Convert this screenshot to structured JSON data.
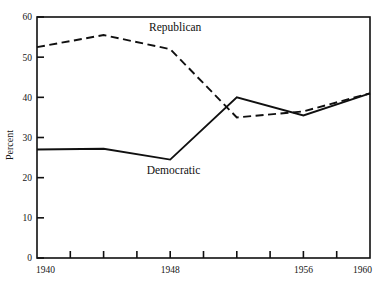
{
  "chart_data": {
    "type": "line",
    "title": "",
    "subtitle": "",
    "xlabel": "",
    "ylabel": "Percent",
    "xlim": [
      1940,
      1960
    ],
    "ylim": [
      0,
      60
    ],
    "grid": false,
    "legend_position": "inline-annotation",
    "x": [
      1940,
      1944,
      1948,
      1952,
      1956,
      1960
    ],
    "x_tick_values": [
      1940,
      1942,
      1944,
      1946,
      1948,
      1950,
      1952,
      1954,
      1956,
      1958,
      1960
    ],
    "x_tick_labels": [
      "1940",
      "",
      "",
      "",
      "1948",
      "",
      "",
      "",
      "1956",
      "",
      "1960"
    ],
    "y_tick_values": [
      0,
      10,
      20,
      30,
      40,
      50,
      60
    ],
    "y_tick_labels": [
      "0",
      "10",
      "20",
      "30",
      "40",
      "50",
      "60"
    ],
    "series": [
      {
        "name": "Republican",
        "style": "dashed",
        "color": "#101010",
        "values": [
          52.5,
          55.5,
          52.0,
          35.0,
          36.5,
          41.0
        ],
        "label": "Republican",
        "label_x": 1948.3,
        "label_y": 56.5
      },
      {
        "name": "Democratic",
        "style": "solid",
        "color": "#101010",
        "values": [
          27.0,
          27.2,
          24.5,
          40.0,
          35.5,
          41.0
        ],
        "label": "Democratic",
        "label_x": 1948.2,
        "label_y": 21.0
      }
    ],
    "annotations": [
      {
        "text": "Republican",
        "x": 1948.3,
        "y": 56.5
      },
      {
        "text": "Democratic",
        "x": 1948.2,
        "y": 21.0
      }
    ]
  },
  "axis": {
    "y_label": "Percent",
    "y_ticks": [
      "60",
      "50",
      "40",
      "30",
      "20",
      "10",
      "0"
    ],
    "x_ticks": [
      "1940",
      "1948",
      "1956",
      "1960"
    ]
  },
  "labels": {
    "republican": "Republican",
    "democratic": "Democratic"
  }
}
